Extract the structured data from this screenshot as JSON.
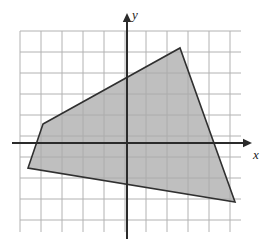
{
  "figure": {
    "width": 274,
    "height": 248,
    "background_color": "#ffffff"
  },
  "axes": {
    "x_label": "x",
    "y_label": "y",
    "origin_px": [
      127,
      143
    ],
    "axis_color": "#2b2b2b",
    "x_axis_arrow_tip_px": [
      252,
      143
    ],
    "y_axis_arrow_tip_px": [
      127,
      13
    ]
  },
  "grid": {
    "color": "#b2b2b2",
    "cell_size_px": 21,
    "left_px": 20,
    "top_px": 31,
    "right_px": 241,
    "bottom_px": 232,
    "columns": 11,
    "rows": 10,
    "visible": true
  },
  "chart_data": {
    "type": "scatter",
    "title": "",
    "xlabel": "x",
    "ylabel": "y",
    "grid": true,
    "legend": null,
    "axis_units_per_cell": 1,
    "xlim": [
      -5.1,
      5.4
    ],
    "ylim": [
      -4.2,
      5.3
    ],
    "annotations": [],
    "shapes": [
      {
        "name": "shaded-quadrilateral",
        "kind": "polygon",
        "fill": "#a9a9a9",
        "fill_opacity": 0.75,
        "stroke": "#303030",
        "stroke_width": 1.6,
        "vertices_px": [
          [
            43,
            124
          ],
          [
            180,
            48
          ],
          [
            235,
            202
          ],
          [
            28,
            168
          ]
        ],
        "vertices_units": [
          [
            -4.0,
            0.9
          ],
          [
            2.5,
            4.5
          ],
          [
            5.1,
            -2.8
          ],
          [
            -4.7,
            -1.2
          ]
        ]
      }
    ]
  }
}
